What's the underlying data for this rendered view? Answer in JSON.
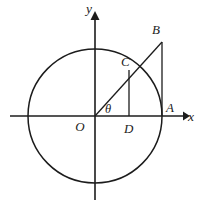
{
  "figure": {
    "name": "unit-circle-trig-diagram",
    "width": 203,
    "height": 209,
    "background_color": "#ffffff",
    "stroke_color": "#1c1c1c"
  },
  "axes": {
    "x_label": "x",
    "y_label": "y",
    "origin_label": "O",
    "x_axis": {
      "x1": 10,
      "y1": 116,
      "x2": 185,
      "y2": 116
    },
    "y_axis": {
      "x1": 95,
      "y1": 12,
      "x2": 95,
      "y2": 200
    },
    "x_label_pos": {
      "x": 191,
      "y": 121
    },
    "y_label_pos": {
      "x": 89,
      "y": 13
    },
    "origin_label_pos": {
      "x": 80,
      "y": 131
    }
  },
  "circle": {
    "center_x": 95,
    "center_y": 116,
    "radius": 67,
    "label": "circle"
  },
  "angle": {
    "symbol": "θ",
    "label_pos": {
      "x": 105,
      "y": 113
    },
    "vertex": {
      "x": 95,
      "y": 116
    }
  },
  "points": [
    {
      "id": "A",
      "label": "A",
      "x": 162,
      "y": 116,
      "label_x": 166,
      "label_y": 112,
      "description": "intersection of circle and positive x-axis"
    },
    {
      "id": "B",
      "label": "B",
      "x": 162,
      "y": 42,
      "label_x": 152,
      "label_y": 34,
      "description": "top of tangent line at A, on ray from O through C"
    },
    {
      "id": "C",
      "label": "C",
      "x": 129,
      "y": 70,
      "label_x": 121,
      "label_y": 66,
      "description": "intersection of circle and ray OB"
    },
    {
      "id": "D",
      "label": "D",
      "x": 129,
      "y": 116,
      "label_x": 124,
      "label_y": 133,
      "description": "foot of perpendicular from C to x-axis"
    }
  ],
  "segments": [
    {
      "id": "OB",
      "label": "ray from origin through C to B",
      "x1": 95,
      "y1": 116,
      "x2": 162,
      "y2": 42
    },
    {
      "id": "CD",
      "label": "perpendicular from C to x-axis at D",
      "x1": 129,
      "y1": 70,
      "x2": 129,
      "y2": 116
    },
    {
      "id": "AB",
      "label": "tangent segment from A up to B",
      "x1": 162,
      "y1": 116,
      "x2": 162,
      "y2": 42
    }
  ],
  "arrows": {
    "x_arrow": {
      "tip_x": 186,
      "tip_y": 116
    },
    "y_arrow": {
      "tip_x": 95,
      "tip_y": 11
    }
  }
}
